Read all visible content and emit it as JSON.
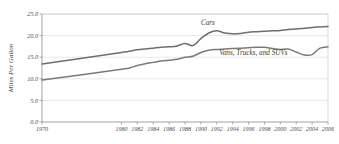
{
  "chart_data": {
    "type": "line",
    "title": "",
    "xlabel": "",
    "ylabel": "Miles Per Gallon",
    "ylim": [
      0.0,
      25.0
    ],
    "xlim": [
      1970,
      2006
    ],
    "grid": true,
    "legend_position": "inline-annotations",
    "ytick_labels": [
      "0.0",
      "5.0",
      "10.0",
      "15.0",
      "20.0",
      "25.0"
    ],
    "ytick_values": [
      0.0,
      5.0,
      10.0,
      15.0,
      20.0,
      25.0
    ],
    "xtick_labels": [
      "1970",
      "1980",
      "1982",
      "1984",
      "1986",
      "1988",
      "1990",
      "1992",
      "1994",
      "1996",
      "1998",
      "2000",
      "2002",
      "2004",
      "2006"
    ],
    "xtick_values": [
      1970,
      1980,
      1982,
      1984,
      1986,
      1988,
      1990,
      1992,
      1994,
      1996,
      1998,
      2000,
      2002,
      2004,
      2006
    ],
    "x": [
      1970,
      1980,
      1981,
      1982,
      1983,
      1984,
      1985,
      1986,
      1987,
      1988,
      1989,
      1990,
      1991,
      1992,
      1993,
      1994,
      1995,
      1996,
      1997,
      1998,
      1999,
      2000,
      2001,
      2002,
      2003,
      2004,
      2005,
      2006
    ],
    "series": [
      {
        "name": "Cars",
        "color": "#6e6e6e",
        "label_x": 1990,
        "label_y": 22.4,
        "values": [
          13.4,
          16.1,
          16.4,
          16.7,
          16.9,
          17.1,
          17.3,
          17.4,
          17.6,
          18.2,
          17.7,
          19.3,
          20.6,
          21.1,
          20.6,
          20.4,
          20.5,
          20.8,
          20.9,
          21.0,
          21.1,
          21.2,
          21.4,
          21.5,
          21.7,
          21.9,
          22.0,
          22.1
        ]
      },
      {
        "name": "Vans, Trucks, and SUVs",
        "color": "#7a7a7a",
        "label_x": 1992.3,
        "label_y": 15.6,
        "values": [
          9.7,
          12.2,
          12.5,
          13.1,
          13.5,
          13.8,
          14.1,
          14.3,
          14.5,
          15.0,
          15.2,
          16.1,
          16.6,
          16.8,
          16.9,
          17.0,
          17.1,
          17.2,
          17.3,
          17.3,
          17.0,
          16.8,
          16.9,
          16.2,
          15.5,
          15.6,
          17.1,
          17.4
        ]
      }
    ]
  },
  "plot": {
    "width": 339,
    "height": 144,
    "left": 42,
    "right": 328,
    "top": 14,
    "bottom": 122
  }
}
